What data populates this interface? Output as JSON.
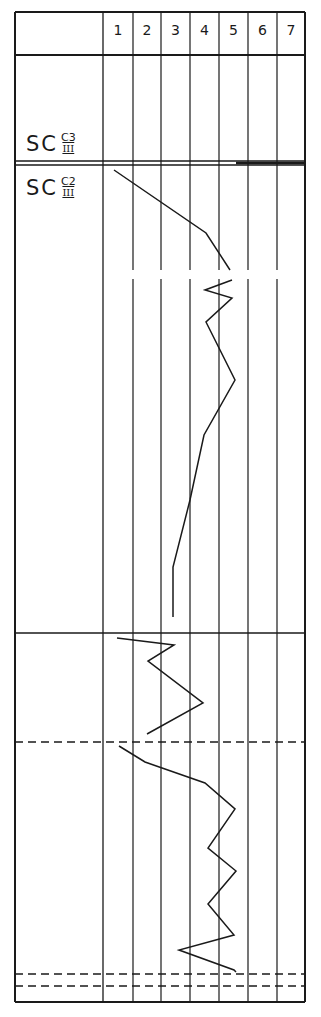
{
  "chart_data": {
    "type": "line",
    "title": "",
    "columns": [
      "1",
      "2",
      "3",
      "4",
      "5",
      "6",
      "7"
    ],
    "rows": [
      {
        "label_main": "SC",
        "label_sup": "C3",
        "label_sub": "III"
      },
      {
        "label_main": "SC",
        "label_sup": "C2",
        "label_sub": "III"
      }
    ],
    "grid": {
      "left": 15,
      "right": 305,
      "top": 12,
      "bottom": 1002,
      "label_col_right": 103,
      "col_lines": [
        103,
        133,
        161,
        190,
        219,
        248,
        277,
        305
      ],
      "header_bottom": 55,
      "double_line_y": [
        161,
        165
      ],
      "solid_h_lines": [
        633
      ],
      "dashed_h_lines": [
        742,
        974,
        986
      ],
      "break_gap": [
        270,
        279
      ]
    },
    "series": [
      {
        "name": "profile-segment-1",
        "points": [
          [
            114,
            170
          ],
          [
            206,
            233
          ],
          [
            230,
            270
          ]
        ]
      },
      {
        "name": "profile-segment-1b",
        "points": [
          [
            232,
            280
          ],
          [
            205,
            290
          ],
          [
            232,
            298
          ],
          [
            206,
            322
          ],
          [
            235,
            380
          ],
          [
            204,
            435
          ],
          [
            190,
            500
          ],
          [
            173,
            567
          ],
          [
            173,
            617
          ]
        ]
      },
      {
        "name": "profile-segment-2",
        "points": [
          [
            117,
            638
          ],
          [
            174,
            645
          ],
          [
            148,
            661
          ],
          [
            203,
            703
          ],
          [
            147,
            734
          ]
        ]
      },
      {
        "name": "profile-segment-3",
        "points": [
          [
            119,
            746
          ],
          [
            145,
            762
          ],
          [
            205,
            783
          ],
          [
            235,
            809
          ],
          [
            208,
            848
          ],
          [
            236,
            871
          ],
          [
            208,
            904
          ],
          [
            234,
            935
          ],
          [
            179,
            950
          ],
          [
            234,
            970
          ],
          [
            236,
            972
          ]
        ]
      }
    ],
    "values_scale": {
      "x_min_col": 1,
      "x_max_col": 7
    }
  },
  "header": {
    "col_labels": [
      "1",
      "2",
      "3",
      "4",
      "5",
      "6",
      "7"
    ]
  },
  "labels": {
    "row1": {
      "main": "SC",
      "sup": "C3",
      "sub": "III"
    },
    "row2": {
      "main": "SC",
      "sup": "C2",
      "sub": "III"
    }
  }
}
